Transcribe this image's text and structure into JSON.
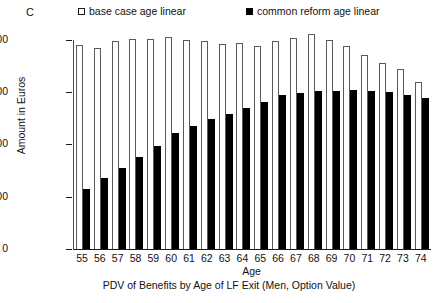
{
  "panel": {
    "label": "C"
  },
  "legend": {
    "position": "top",
    "items": [
      {
        "label": "base case age linear",
        "marker": "open-square",
        "color": "#ffffff"
      },
      {
        "label": "common reform age linear",
        "marker": "filled-square",
        "color": "#000000"
      }
    ]
  },
  "axes": {
    "y_label": "Amount in Euros",
    "x_label": "Age",
    "y_ticks": [
      "0",
      "50,000",
      "100,000",
      "150,000",
      "200,000"
    ]
  },
  "caption": "PDV of Benefits by Age of LF Exit (Men, Option Value)",
  "chart_data": {
    "type": "bar",
    "title": "PDV of Benefits by Age of LF Exit (Men, Option Value)",
    "xlabel": "Age",
    "ylabel": "Amount in Euros",
    "ylim": [
      0,
      200000
    ],
    "yticks": [
      0,
      50000,
      100000,
      150000,
      200000
    ],
    "grid": false,
    "legend_position": "top",
    "categories": [
      "55",
      "56",
      "57",
      "58",
      "59",
      "60",
      "61",
      "62",
      "63",
      "64",
      "65",
      "66",
      "67",
      "68",
      "69",
      "70",
      "71",
      "72",
      "73",
      "74"
    ],
    "series": [
      {
        "name": "base case age linear",
        "marker": "open-square",
        "values": [
          195000,
          192000,
          199000,
          201000,
          201000,
          203000,
          200000,
          199000,
          196000,
          197000,
          194000,
          199000,
          202000,
          206000,
          200000,
          194000,
          186000,
          178000,
          172000,
          160000
        ]
      },
      {
        "name": "common reform age linear",
        "marker": "filled-square",
        "values": [
          57000,
          68000,
          78000,
          88000,
          99000,
          111000,
          118000,
          124000,
          129000,
          135000,
          141000,
          147000,
          149000,
          151000,
          151000,
          152000,
          151000,
          150000,
          147000,
          145000
        ]
      }
    ]
  }
}
